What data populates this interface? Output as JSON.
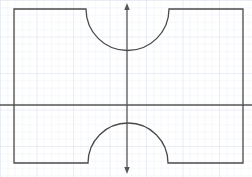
{
  "figure": {
    "canvas": {
      "width": 252,
      "height": 177,
      "background": "#ffffff"
    },
    "grid": {
      "visible": true,
      "spacing": 7.3,
      "minor_color": "#e8ecf2",
      "major_color": "#dce3ec",
      "major_every": 5
    },
    "axes": {
      "x_axis": {
        "label": "x-axis",
        "orientation": "horizontal",
        "y_position": 105,
        "x_start": 0,
        "x_end": 252,
        "color": "#555555",
        "width": 1.3,
        "arrow": "none"
      },
      "y_axis": {
        "label": "y-axis",
        "orientation": "vertical",
        "x_position": 127,
        "y_start": 6,
        "y_end": 171,
        "color": "#555555",
        "width": 1.3,
        "arrow": "both"
      },
      "origin": {
        "x": 127,
        "y": 105
      }
    },
    "shape": {
      "name": "notched-rectangle",
      "stroke_color": "#4a4a4a",
      "stroke_width": 1.3,
      "fill": "none",
      "rectangle": {
        "left": 14,
        "right": 243,
        "top": 9,
        "bottom": 163
      },
      "notches": [
        {
          "name": "top-notch",
          "type": "semicircle",
          "opens": "upward",
          "cut_from_edge": "top",
          "left": 86,
          "right": 169,
          "center_x": 127.5,
          "center_y": 9,
          "radius": 41.5,
          "extreme_y": 50.5
        },
        {
          "name": "bottom-notch",
          "type": "semicircle",
          "opens": "downward",
          "cut_from_edge": "bottom",
          "left": 88,
          "right": 168,
          "center_x": 128,
          "center_y": 163,
          "radius": 40,
          "extreme_y": 119
        }
      ]
    }
  }
}
